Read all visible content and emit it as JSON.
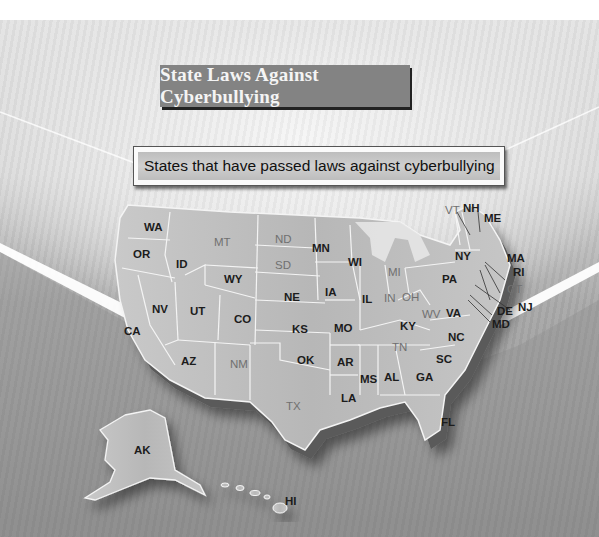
{
  "title": "State Laws Against Cyberbullying",
  "subtitle": "States that have passed laws against cyberbullying",
  "colors": {
    "title_box": "#838383",
    "title_text": "#f4f4f4",
    "law_state_label": "#1c1c1c",
    "no_law_state_label": "#707070",
    "state_fill": "#bdbdbd",
    "state_border": "#f2f2f2"
  },
  "map": {
    "region": "United States",
    "states_with_law": [
      "WA",
      "OR",
      "CA",
      "ID",
      "NV",
      "UT",
      "AZ",
      "WY",
      "CO",
      "NE",
      "KS",
      "OK",
      "MN",
      "IA",
      "MO",
      "AR",
      "LA",
      "WI",
      "IL",
      "KY",
      "MS",
      "AL",
      "GA",
      "FL",
      "SC",
      "NC",
      "VA",
      "PA",
      "NY",
      "NH",
      "ME",
      "MA",
      "RI",
      "NJ",
      "DE",
      "MD",
      "AK",
      "HI"
    ],
    "states_without_law": [
      "MT",
      "ND",
      "SD",
      "NM",
      "TX",
      "MI",
      "IN",
      "OH",
      "WV",
      "TN",
      "VT",
      "CT"
    ],
    "labels": {
      "WA": "WA",
      "OR": "OR",
      "CA": "CA",
      "ID": "ID",
      "NV": "NV",
      "UT": "UT",
      "AZ": "AZ",
      "MT": "MT",
      "WY": "WY",
      "CO": "CO",
      "NM": "NM",
      "ND": "ND",
      "SD": "SD",
      "NE": "NE",
      "KS": "KS",
      "OK": "OK",
      "TX": "TX",
      "MN": "MN",
      "IA": "IA",
      "MO": "MO",
      "AR": "AR",
      "LA": "LA",
      "WI": "WI",
      "IL": "IL",
      "MI": "MI",
      "IN": "IN",
      "OH": "OH",
      "KY": "KY",
      "TN": "TN",
      "MS": "MS",
      "AL": "AL",
      "GA": "GA",
      "FL": "FL",
      "SC": "SC",
      "NC": "NC",
      "VA": "VA",
      "WV": "WV",
      "PA": "PA",
      "NY": "NY",
      "VT": "VT",
      "NH": "NH",
      "ME": "ME",
      "MA": "MA",
      "RI": "RI",
      "CT": "CT",
      "NJ": "NJ",
      "DE": "DE",
      "MD": "MD",
      "AK": "AK",
      "HI": "HI"
    }
  }
}
